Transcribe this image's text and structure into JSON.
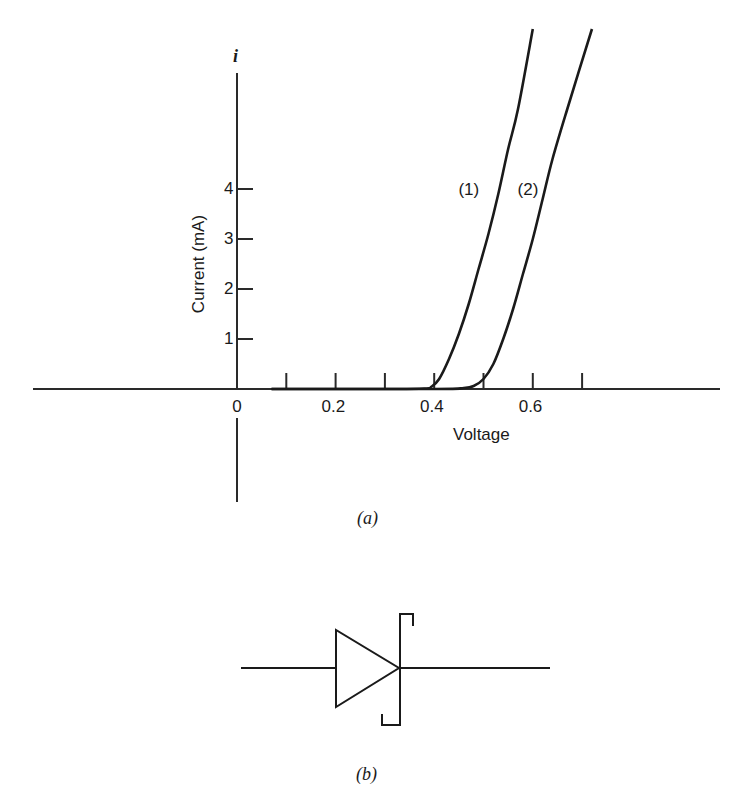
{
  "figure": {
    "caption_a": "(a)",
    "caption_b": "(b)"
  },
  "chart_data": {
    "type": "line",
    "title": "",
    "xlabel": "Voltage",
    "ylabel": "Current (mA)",
    "y_axis_symbol": "i",
    "x_ticks": [
      0.1,
      0.2,
      0.3,
      0.4,
      0.5,
      0.6,
      0.7
    ],
    "x_tick_labels": [
      "0",
      "0.2",
      "0.4",
      "0.6"
    ],
    "x_tick_label_values": [
      0,
      0.2,
      0.4,
      0.6
    ],
    "y_ticks": [
      1,
      2,
      3,
      4
    ],
    "y_tick_labels": [
      "1",
      "2",
      "3",
      "4"
    ],
    "xlim": [
      -0.41,
      0.98
    ],
    "ylim": [
      -2.3,
      7.4
    ],
    "grid": false,
    "legend": null,
    "series": [
      {
        "name": "(1)",
        "x": [
          0.07,
          0.3,
          0.38,
          0.395,
          0.41,
          0.43,
          0.45,
          0.47,
          0.49,
          0.51,
          0.53,
          0.55,
          0.57,
          0.6
        ],
        "y": [
          0,
          0,
          0.01,
          0.05,
          0.2,
          0.6,
          1.1,
          1.7,
          2.4,
          3.1,
          3.9,
          4.8,
          5.6,
          7.2
        ]
      },
      {
        "name": "(2)",
        "x": [
          0.07,
          0.4,
          0.46,
          0.48,
          0.5,
          0.52,
          0.54,
          0.56,
          0.58,
          0.6,
          0.62,
          0.64,
          0.67,
          0.72
        ],
        "y": [
          0,
          0,
          0.02,
          0.06,
          0.2,
          0.5,
          1.0,
          1.6,
          2.3,
          3.0,
          3.8,
          4.6,
          5.6,
          7.2
        ]
      }
    ],
    "annotations": [
      {
        "text": "(1)",
        "x": 0.51,
        "y": 4.0
      },
      {
        "text": "(2)",
        "x": 0.63,
        "y": 4.0
      }
    ]
  },
  "diagram_b": {
    "description": "Schottky diode circuit symbol"
  }
}
